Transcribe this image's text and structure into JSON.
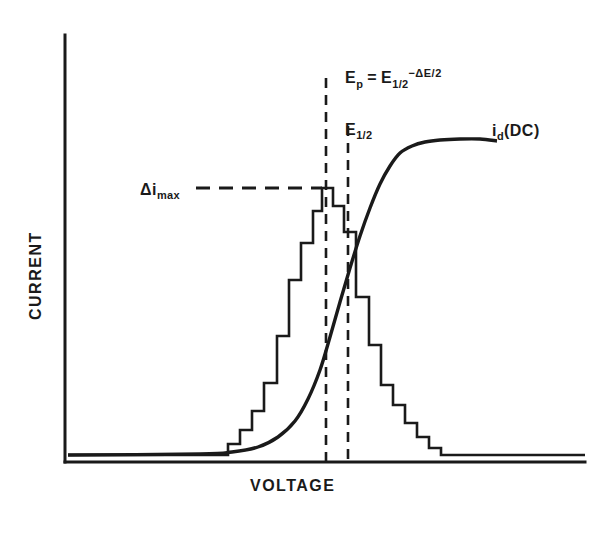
{
  "figure": {
    "axes": {
      "y_label": "CURRENT",
      "x_label": "VOLTAGE"
    },
    "annotations": {
      "peak_symbol": "Δi",
      "peak_subscript": "max",
      "ep_symbol": "E",
      "ep_subscript": "p",
      "equals": "=",
      "ehalf_symbol": "E",
      "ehalf_subscript": "1/2",
      "delta_term": "−ΔE/2",
      "ehalf_line_symbol": "E",
      "ehalf_line_subscript": "1/2",
      "dc_symbol": "i",
      "dc_subscript": "d",
      "dc_paren": "(DC)"
    },
    "colors": {
      "ink": "#1a1a1a",
      "background": "#ffffff"
    }
  },
  "chart_data": {
    "type": "line",
    "title": "",
    "xlabel": "VOLTAGE",
    "ylabel": "CURRENT",
    "grid": false,
    "legend": false,
    "axis_pixel_frame": {
      "x_axis_y": 462,
      "y_axis_x": 65,
      "y_axis_top": 35,
      "x_axis_right": 585,
      "baseline_y": 455
    },
    "series": [
      {
        "name": "differential pulse staircase",
        "style": "step",
        "comment": "Pixel coordinates of the staircase trace, left tail to right tail",
        "points": [
          [
            68,
            455
          ],
          [
            228,
            455
          ],
          [
            228,
            444
          ],
          [
            240,
            444
          ],
          [
            240,
            430
          ],
          [
            252,
            430
          ],
          [
            252,
            411
          ],
          [
            264,
            411
          ],
          [
            264,
            383
          ],
          [
            277,
            383
          ],
          [
            277,
            336
          ],
          [
            289,
            336
          ],
          [
            289,
            280
          ],
          [
            301,
            280
          ],
          [
            301,
            243
          ],
          [
            313,
            243
          ],
          [
            313,
            211
          ],
          [
            322,
            211
          ],
          [
            322,
            188
          ],
          [
            333,
            188
          ],
          [
            333,
            206
          ],
          [
            344,
            206
          ],
          [
            344,
            232
          ],
          [
            356,
            232
          ],
          [
            356,
            297
          ],
          [
            369,
            297
          ],
          [
            369,
            345
          ],
          [
            381,
            345
          ],
          [
            381,
            385
          ],
          [
            393,
            385
          ],
          [
            393,
            405
          ],
          [
            405,
            405
          ],
          [
            405,
            423
          ],
          [
            417,
            423
          ],
          [
            417,
            437
          ],
          [
            429,
            437
          ],
          [
            429,
            448
          ],
          [
            441,
            448
          ],
          [
            441,
            455
          ],
          [
            585,
            455
          ]
        ]
      },
      {
        "name": "i_d (DC) sigmoid wave",
        "style": "smooth",
        "comment": "Pixel coordinates of the DC polarographic sigmoid curve",
        "points": [
          [
            68,
            455
          ],
          [
            200,
            454
          ],
          [
            232,
            452
          ],
          [
            258,
            447
          ],
          [
            278,
            437
          ],
          [
            295,
            421
          ],
          [
            308,
            399
          ],
          [
            320,
            370
          ],
          [
            330,
            337
          ],
          [
            340,
            302
          ],
          [
            350,
            268
          ],
          [
            360,
            236
          ],
          [
            370,
            208
          ],
          [
            380,
            184
          ],
          [
            390,
            166
          ],
          [
            400,
            153
          ],
          [
            412,
            146
          ],
          [
            425,
            142
          ],
          [
            440,
            140
          ],
          [
            460,
            139
          ],
          [
            480,
            139
          ],
          [
            497,
            141
          ]
        ]
      }
    ],
    "reference_lines": [
      {
        "name": "E_p vertical dashed line",
        "orientation": "vertical",
        "x": 326,
        "y_start": 78,
        "y_end": 462,
        "dash": "10,7"
      },
      {
        "name": "E_1/2 vertical dashed line",
        "orientation": "vertical",
        "x": 348,
        "y_start": 126,
        "y_end": 462,
        "dash": "10,7"
      },
      {
        "name": "delta i max horizontal dashed line",
        "orientation": "horizontal",
        "y": 188,
        "x_start": 196,
        "x_end": 322,
        "dash": "14,9"
      }
    ]
  }
}
